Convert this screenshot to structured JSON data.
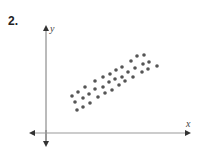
{
  "problem_number": "2.",
  "axes": {
    "x_label": "x",
    "y_label": "y"
  },
  "chart_data": {
    "type": "scatter",
    "title": "",
    "xlabel": "x",
    "ylabel": "y",
    "grid": false,
    "points": [
      [
        72,
        96
      ],
      [
        78,
        92
      ],
      [
        85,
        87
      ],
      [
        95,
        81
      ],
      [
        103,
        77
      ],
      [
        110,
        74
      ],
      [
        116,
        70
      ],
      [
        122,
        67
      ],
      [
        131,
        61
      ],
      [
        137,
        56
      ],
      [
        144,
        55
      ],
      [
        75,
        102
      ],
      [
        83,
        98
      ],
      [
        89,
        94
      ],
      [
        95,
        89
      ],
      [
        103,
        87
      ],
      [
        109,
        82
      ],
      [
        115,
        79
      ],
      [
        122,
        77
      ],
      [
        128,
        72
      ],
      [
        135,
        68
      ],
      [
        143,
        64
      ],
      [
        149,
        62
      ],
      [
        77,
        110
      ],
      [
        83,
        107
      ],
      [
        90,
        103
      ],
      [
        98,
        97
      ],
      [
        105,
        93
      ],
      [
        112,
        90
      ],
      [
        119,
        85
      ],
      [
        125,
        81
      ],
      [
        133,
        77
      ],
      [
        142,
        72
      ],
      [
        148,
        69
      ],
      [
        157,
        66
      ]
    ],
    "point_units": "relative position units in the plotted region (origin at axes intersection, y up)",
    "axis_origin": [
      46,
      130
    ],
    "dot_color": "#555555"
  }
}
